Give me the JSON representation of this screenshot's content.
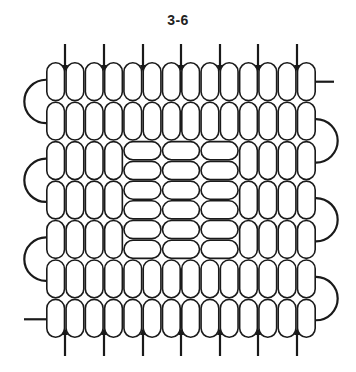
{
  "figure": {
    "label": "3-6",
    "grid": {
      "columns": 14,
      "rows": 7,
      "origin_x": 46,
      "origin_y": 62,
      "width": 270,
      "height": 276
    },
    "center_block": {
      "start_column": 4,
      "end_column": 10,
      "start_row": 2,
      "end_row": 5,
      "beads_across": 3,
      "beads_down": 6
    },
    "top_arrows_x": [
      65,
      104,
      143,
      181,
      220,
      258,
      297
    ],
    "bottom_arrows_x": [
      65,
      104,
      143,
      181,
      220,
      258,
      297
    ],
    "left_loops_rows": [
      [
        0,
        1
      ],
      [
        2,
        3
      ],
      [
        4,
        5
      ]
    ],
    "right_loops_rows": [
      [
        1,
        2
      ],
      [
        3,
        4
      ],
      [
        5,
        6
      ]
    ],
    "left_lead_row": 6,
    "right_lead_row": 0,
    "colors": {
      "stroke": "#1a1a1a",
      "bead_fill": "#ffffff",
      "background": "#ffffff"
    }
  }
}
